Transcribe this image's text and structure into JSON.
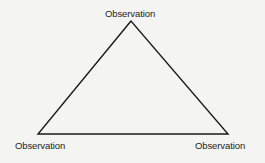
{
  "diagram": {
    "type": "triangle",
    "stroke_color": "#1a1a1a",
    "background_color": "#f4f4f2",
    "vertices": [
      {
        "id": "top",
        "label": "Observation"
      },
      {
        "id": "bottom-left",
        "label": "Observation"
      },
      {
        "id": "bottom-right",
        "label": "Observation"
      }
    ]
  }
}
